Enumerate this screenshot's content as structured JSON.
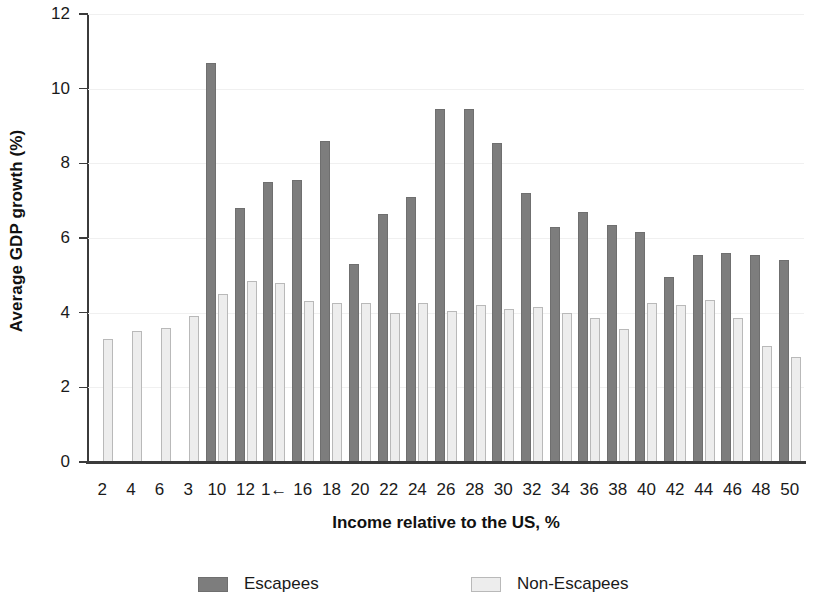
{
  "chart_data": {
    "type": "bar",
    "title": "",
    "xlabel": "Income relative to the US, %",
    "ylabel": "Average GDP growth (%)",
    "ylim": [
      0,
      12
    ],
    "yticks": [
      0,
      2,
      4,
      6,
      8,
      10,
      12
    ],
    "ytick_labels": [
      "0",
      "2",
      "4",
      "6",
      "8",
      "10",
      "12"
    ],
    "grid": true,
    "legend_position": "bottom",
    "categories": [
      2,
      4,
      6,
      8,
      10,
      12,
      14,
      16,
      18,
      20,
      22,
      24,
      26,
      28,
      30,
      32,
      34,
      36,
      38,
      40,
      42,
      44,
      46,
      48,
      50
    ],
    "xtick_labels": [
      "2",
      "4",
      "6",
      "3",
      "10",
      "12",
      "1←",
      "16",
      "18",
      "20",
      "22",
      "24",
      "26",
      "28",
      "30",
      "32",
      "34",
      "36",
      "38",
      "40",
      "42",
      "44",
      "46",
      "48",
      "50"
    ],
    "series": [
      {
        "name": "Escapees",
        "color": "#7d7d7d",
        "values": [
          null,
          null,
          null,
          null,
          10.7,
          6.8,
          7.5,
          7.55,
          8.6,
          5.3,
          6.65,
          7.1,
          9.45,
          9.45,
          8.55,
          7.2,
          6.3,
          6.7,
          6.35,
          6.15,
          4.95,
          5.55,
          5.6,
          5.55,
          5.4
        ]
      },
      {
        "name": "Non-Escapees",
        "color": "#ededed",
        "values": [
          3.3,
          3.5,
          3.6,
          3.9,
          4.5,
          4.85,
          4.8,
          4.3,
          4.25,
          4.25,
          4.0,
          4.25,
          4.05,
          4.2,
          4.1,
          4.15,
          4.0,
          3.85,
          3.55,
          4.25,
          4.2,
          4.35,
          3.85,
          3.1,
          2.8
        ]
      }
    ]
  },
  "legend": {
    "items": [
      {
        "label": "Escapees"
      },
      {
        "label": "Non-Escapees"
      }
    ]
  }
}
